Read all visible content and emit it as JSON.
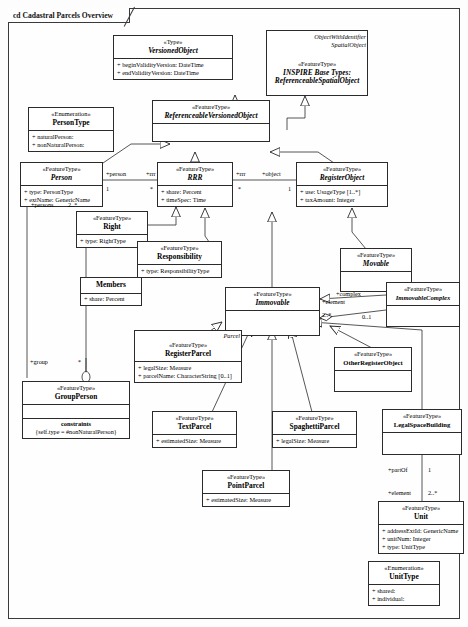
{
  "diagram": {
    "kind_prefix": "cd",
    "title": "cd Cadastral Parcels Overview"
  },
  "classes": [
    {
      "id": "versionedObject",
      "stereotype": "«Type»",
      "name": "VersionedObject",
      "attributes": [
        "+ beginValidityVersion:  DateTime",
        "+ endValidityVersion:  DateTime"
      ]
    },
    {
      "id": "inspireBase",
      "stereotype": "«FeatureType»",
      "name_line1": "INSPIRE Base Types:",
      "name": "ReferenceableSpatialObject",
      "caption_line1": "ObjectWithIdentifier",
      "caption_line2": "SpatialObject",
      "attributes": []
    },
    {
      "id": "personType",
      "stereotype": "«Enumeration»",
      "name": "PersonType",
      "attributes": [
        "+ naturalPerson:",
        "+ nonNaturalPerson:"
      ]
    },
    {
      "id": "referenceableVersionedObject",
      "stereotype": "«FeatureType»",
      "name": "ReferenceableVersionedObject",
      "attributes": []
    },
    {
      "id": "person",
      "stereotype": "«FeatureType»",
      "name": "Person",
      "attributes": [
        "+ type:  PersonType",
        "+ extName:  GenericName"
      ]
    },
    {
      "id": "rrr",
      "stereotype": "«FeatureType»",
      "name": "RRR",
      "attributes": [
        "+ share:  Percent",
        "+ timeSpec:  Time"
      ]
    },
    {
      "id": "registerObject",
      "stereotype": "«FeatureType»",
      "name": "RegisterObject",
      "attributes": [
        "+ use:  UsageType [1..*]",
        "+ taxAmount:  Integer"
      ]
    },
    {
      "id": "right",
      "stereotype": "«FeatureType»",
      "name": "Right",
      "attributes": [
        "+ type:  RightType"
      ]
    },
    {
      "id": "responsibility",
      "stereotype": "«FeatureType»",
      "name": "Responsibility",
      "attributes": [
        "+ type:  ResponsibilityType"
      ]
    },
    {
      "id": "members",
      "stereotype": "",
      "name": "Members",
      "attributes": [
        "+ share:  Percent"
      ]
    },
    {
      "id": "movable",
      "stereotype": "«FeatureType»",
      "name": "Movable",
      "attributes": []
    },
    {
      "id": "immovable",
      "stereotype": "«FeatureType»",
      "name": "Immovable",
      "attributes": []
    },
    {
      "id": "immovableComplex",
      "stereotype": "«FeatureType»",
      "name": "ImmovableComplex",
      "attributes": []
    },
    {
      "id": "registerParcel",
      "stereotype": "«FeatureType»",
      "name": "RegisterParcel",
      "caption_line1": "Parcel",
      "attributes": [
        "+ legalSize:  Measure",
        "+ parcelName:  CharacterString [0..1]"
      ]
    },
    {
      "id": "otherRegisterObject",
      "stereotype": "«FeatureType»",
      "name": "OtherRegisterObject",
      "attributes": []
    },
    {
      "id": "groupPerson",
      "stereotype": "«FeatureType»",
      "name": "GroupPerson",
      "attributes": [],
      "constraint_title": "constraints",
      "constraint_body": "{self.type = #nonNaturalPerson}"
    },
    {
      "id": "textParcel",
      "stereotype": "«FeatureType»",
      "name": "TextParcel",
      "attributes": [
        "+ estimatedSize:  Measure"
      ]
    },
    {
      "id": "spaghettiParcel",
      "stereotype": "«FeatureType»",
      "name": "SpaghettiParcel",
      "attributes": [
        "+ legalSize:  Measure"
      ]
    },
    {
      "id": "pointParcel",
      "stereotype": "«FeatureType»",
      "name": "PointParcel",
      "attributes": [
        "+ estimatedSize:  Measure"
      ]
    },
    {
      "id": "legalSpaceBuilding",
      "stereotype": "«FeatureType»",
      "name": "LegalSpaceBuilding",
      "attributes": []
    },
    {
      "id": "unit",
      "stereotype": "«FeatureType»",
      "name": "Unit",
      "attributes": [
        "+ addressExtId:  GenericName",
        "+ unitNum:  Integer",
        "+ type:  UnitType"
      ]
    },
    {
      "id": "unitType",
      "stereotype": "«Enumeration»",
      "name": "UnitType",
      "attributes": [
        "+ shared:",
        "+ individual:"
      ]
    }
  ],
  "association_labels": {
    "person_role": "+person",
    "person_mult": "1",
    "rrr_role_left": "+rrr",
    "rrr_mult_left": "*",
    "rrr_role_right": "+rrr",
    "rrr_mult_right": "*",
    "object_role": "+object",
    "object_mult": "1",
    "persons_role": "+persons",
    "persons_mult": "2..*",
    "group_role": "+group",
    "group_mult": "*",
    "complex_role": "+complex",
    "complex_mult": "0..1",
    "element_role": "+element",
    "element_mult": "2..*",
    "partof_role": "+partOf",
    "partof_mult": "1",
    "unit_element_role": "+element",
    "unit_element_mult": "2..*"
  },
  "colors": {
    "line": "#2b2b2b",
    "background": "#fefefe",
    "text": "#000000"
  }
}
